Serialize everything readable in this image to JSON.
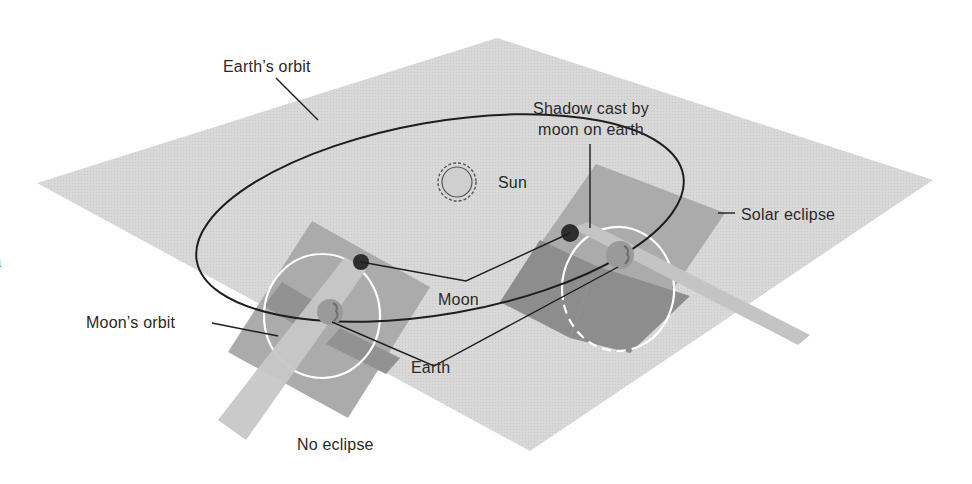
{
  "figure": {
    "colors": {
      "background": "#ffffff",
      "ecliptic_plane": "#d6d6d6",
      "moon_orbit_plane": "#a9a9a9",
      "moon_orbit_plane_dark": "#8f8f8f",
      "shadow_beam": "#c4c4c4",
      "moon_body": "#2e2e2e",
      "earth_body": "#9a9a9a",
      "orbit_line": "#1e1e1e",
      "moon_orbit_ring": "#ffffff",
      "sun_fill": "#cfcfcf",
      "text": "#2a2a2a"
    },
    "edge_glyph": "a"
  },
  "labels": {
    "earths_orbit": "Earth’s orbit",
    "sun": "Sun",
    "shadow_line1": "Shadow cast by",
    "shadow_line2": "moon on earth",
    "solar_eclipse": "Solar eclipse",
    "moon": "Moon",
    "moons_orbit": "Moon’s orbit",
    "earth": "Earth",
    "no_eclipse": "No eclipse"
  },
  "scenes": [
    {
      "name": "No eclipse",
      "moon_position": "above ecliptic plane",
      "shadow_hits_earth": false
    },
    {
      "name": "Solar eclipse",
      "moon_position": "on line of nodes",
      "shadow_hits_earth": true
    }
  ]
}
